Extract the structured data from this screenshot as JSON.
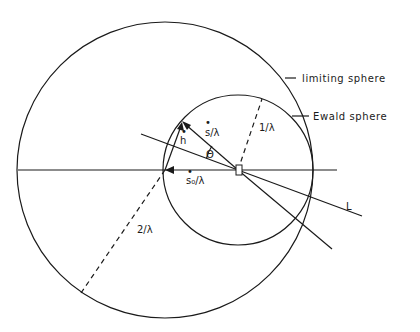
{
  "diagram": {
    "labels": {
      "limiting_sphere": "limiting sphere",
      "ewald_sphere": "Ewald sphere",
      "s_over_lambda": "s/λ",
      "s0_over_lambda": "s₀/λ",
      "h": "h",
      "theta": "Θ",
      "one_over_lambda": "1/λ",
      "two_over_lambda": "2/λ",
      "L": "L",
      "vector_mark": "•"
    },
    "colors": {
      "ink": "#1a1a1a",
      "background": "#ffffff"
    }
  }
}
